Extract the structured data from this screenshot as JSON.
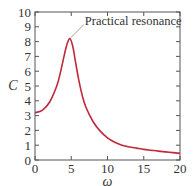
{
  "chart_data": {
    "type": "line",
    "title": "",
    "xlabel": "ω",
    "ylabel": "C",
    "xlim": [
      0,
      20
    ],
    "ylim": [
      0,
      10
    ],
    "xticks": [
      0,
      5,
      10,
      15,
      20
    ],
    "yticks": [
      0,
      1,
      2,
      3,
      4,
      5,
      6,
      7,
      8,
      9,
      10
    ],
    "grid": false,
    "legend": null,
    "series": [
      {
        "name": "C(ω)",
        "color": "#c0283c",
        "x": [
          0,
          1,
          2,
          3,
          3.5,
          4,
          4.4,
          4.8,
          5.2,
          5.6,
          6,
          6.5,
          7,
          8,
          9,
          10,
          11,
          12,
          13,
          14,
          15,
          16,
          17,
          18,
          19,
          20
        ],
        "y": [
          3.2,
          3.35,
          3.9,
          5.0,
          5.9,
          7.0,
          7.8,
          8.2,
          7.7,
          6.6,
          5.5,
          4.4,
          3.6,
          2.6,
          1.95,
          1.5,
          1.2,
          1.0,
          0.88,
          0.8,
          0.72,
          0.66,
          0.6,
          0.55,
          0.5,
          0.45
        ]
      }
    ],
    "annotations": [
      {
        "text": "Practical resonance",
        "x": 4.8,
        "y": 8.2
      }
    ]
  },
  "labels": {
    "annotation": "Practical resonance",
    "xlabel": "ω",
    "ylabel": "C"
  }
}
